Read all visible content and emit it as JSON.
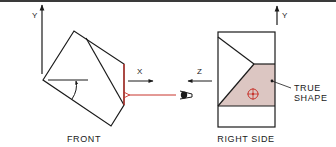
{
  "figure": {
    "views": {
      "front": {
        "label": "FRONT"
      },
      "right_side": {
        "label": "RIGHT SIDE"
      }
    },
    "axes": {
      "front_vertical": "Y",
      "front_horizontal": "X",
      "side_vertical": "Y",
      "side_horizontal": "Z"
    },
    "annotation": {
      "line1": "TRUE",
      "line2": "SHAPE"
    },
    "icons": {
      "line_of_sight": "eye-icon",
      "center_mark": "target-icon"
    },
    "colors": {
      "line": "#1a1a1a",
      "accent_red": "#c8342c",
      "true_shape_fill": "#dcc6c2",
      "border": "#3a3a3a"
    }
  }
}
